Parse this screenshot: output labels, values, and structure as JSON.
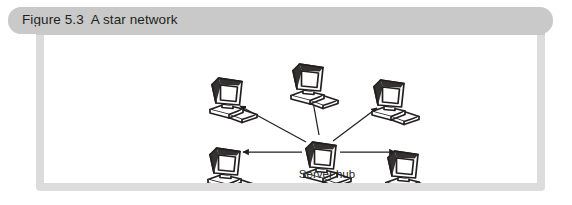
{
  "figure": {
    "header": {
      "title": "Figure 5.3  A star network",
      "background_color": "#c9c9c9",
      "text_color": "#231f20"
    },
    "frame": {
      "border_color": "#dcdcdc",
      "canvas_color": "#ffffff"
    }
  },
  "diagram": {
    "type": "star-network-topology",
    "line_color": "#231f20",
    "icon_name": "desktop-computer-icon",
    "hub": {
      "id": "server-hub",
      "label": "Server hub",
      "x": 252,
      "y": 104
    },
    "nodes": [
      {
        "id": "workstation-upper-left",
        "label": "",
        "x": 158,
        "y": 40
      },
      {
        "id": "workstation-top-center",
        "label": "",
        "x": 239,
        "y": 26
      },
      {
        "id": "workstation-upper-right",
        "label": "",
        "x": 320,
        "y": 42
      },
      {
        "id": "workstation-lower-left",
        "label": "",
        "x": 156,
        "y": 110
      },
      {
        "id": "workstation-lower-right",
        "label": "",
        "x": 334,
        "y": 113
      }
    ],
    "connections": [
      {
        "from": "server-hub",
        "to": "workstation-upper-left",
        "arrow": "outward"
      },
      {
        "from": "server-hub",
        "to": "workstation-top-center",
        "arrow": "outward"
      },
      {
        "from": "server-hub",
        "to": "workstation-upper-right",
        "arrow": "outward"
      },
      {
        "from": "server-hub",
        "to": "workstation-lower-left",
        "arrow": "outward"
      },
      {
        "from": "server-hub",
        "to": "workstation-lower-right",
        "arrow": "outward"
      }
    ]
  }
}
